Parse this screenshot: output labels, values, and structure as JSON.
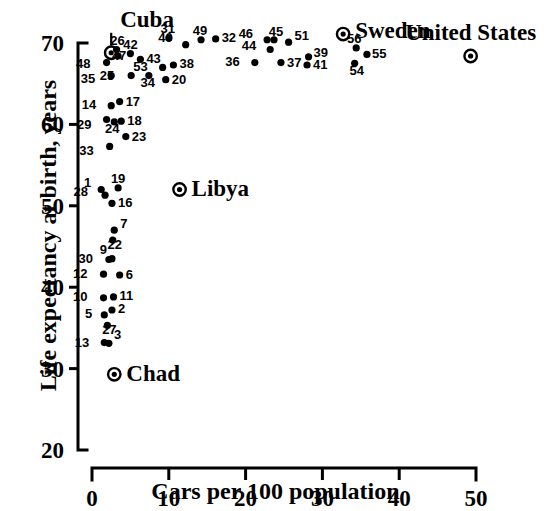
{
  "chart_data": {
    "type": "scatter",
    "title": "",
    "xlabel": "Cars per 100 population",
    "ylabel": "Life expectancy at birth, years",
    "xlim": [
      0,
      50
    ],
    "ylim": [
      20,
      70
    ],
    "xticks": [
      "0",
      "10",
      "20",
      "30",
      "40",
      "50"
    ],
    "xtick_values": [
      0,
      10,
      20,
      30,
      40,
      50
    ],
    "yticks": [
      "20",
      "30",
      "40",
      "50",
      "60",
      "70"
    ],
    "ytick_values": [
      20,
      30,
      40,
      50,
      60,
      70
    ],
    "grid": false,
    "legend": "none",
    "point_label_format": "numeric-index",
    "points": [
      {
        "label": "1",
        "x": 1.2,
        "y": 52.0,
        "label_dx": -10,
        "label_dy": -3
      },
      {
        "label": "2",
        "x": 2.6,
        "y": 37.2,
        "label_dx": 6,
        "label_dy": 3
      },
      {
        "label": "3",
        "x": 2.2,
        "y": 33.1,
        "label_dx": 5,
        "label_dy": -4
      },
      {
        "label": "5",
        "x": 1.6,
        "y": 36.6,
        "label_dx": -12,
        "label_dy": 3
      },
      {
        "label": "6",
        "x": 3.6,
        "y": 41.5,
        "label_dx": 6,
        "label_dy": 4
      },
      {
        "label": "7",
        "x": 2.9,
        "y": 47.0,
        "label_dx": 6,
        "label_dy": -2
      },
      {
        "label": "9",
        "x": 2.6,
        "y": 43.5,
        "label_dx": -5,
        "label_dy": -5
      },
      {
        "label": "10",
        "x": 1.5,
        "y": 38.7,
        "label_dx": -16,
        "label_dy": 3
      },
      {
        "label": "11",
        "x": 2.8,
        "y": 38.8,
        "label_dx": 6,
        "label_dy": 3
      },
      {
        "label": "12",
        "x": 1.5,
        "y": 41.6,
        "label_dx": -16,
        "label_dy": 4
      },
      {
        "label": "13",
        "x": 1.6,
        "y": 33.2,
        "label_dx": -15,
        "label_dy": 4
      },
      {
        "label": "14",
        "x": 2.5,
        "y": 62.3,
        "label_dx": -15,
        "label_dy": 3
      },
      {
        "label": "16",
        "x": 2.6,
        "y": 50.3,
        "label_dx": 6,
        "label_dy": 4
      },
      {
        "label": "17",
        "x": 3.6,
        "y": 62.8,
        "label_dx": 6,
        "label_dy": 4
      },
      {
        "label": "18",
        "x": 3.8,
        "y": 60.4,
        "label_dx": 6,
        "label_dy": 4
      },
      {
        "label": "19",
        "x": 3.4,
        "y": 52.2,
        "label_dx": 0,
        "label_dy": -5
      },
      {
        "label": "20",
        "x": 9.6,
        "y": 65.5,
        "label_dx": 6,
        "label_dy": 4
      },
      {
        "label": "22",
        "x": 2.7,
        "y": 45.8,
        "label_dx": 2,
        "label_dy": 9
      },
      {
        "label": "23",
        "x": 4.4,
        "y": 58.5,
        "label_dx": 6,
        "label_dy": 4
      },
      {
        "label": "24",
        "x": 2.9,
        "y": 60.3,
        "label_dx": -2,
        "label_dy": 11
      },
      {
        "label": "25",
        "x": 5.1,
        "y": 66.0,
        "label_dx": -17,
        "label_dy": 4
      },
      {
        "label": "26",
        "x": 3.2,
        "y": 69.2,
        "label_dx": 1,
        "label_dy": -5
      },
      {
        "label": "27",
        "x": 2.0,
        "y": 35.3,
        "label_dx": 2,
        "label_dy": 9
      },
      {
        "label": "28",
        "x": 1.7,
        "y": 51.3,
        "label_dx": -17,
        "label_dy": 1
      },
      {
        "label": "29",
        "x": 1.9,
        "y": 60.6,
        "label_dx": -15,
        "label_dy": 9
      },
      {
        "label": "30",
        "x": 2.2,
        "y": 43.4,
        "label_dx": -16,
        "label_dy": 3
      },
      {
        "label": "31",
        "x": 10.0,
        "y": 70.6,
        "label_dx": -1,
        "label_dy": -5
      },
      {
        "label": "32",
        "x": 16.1,
        "y": 70.5,
        "label_dx": 6,
        "label_dy": 3
      },
      {
        "label": "33",
        "x": 2.3,
        "y": 57.3,
        "label_dx": -16,
        "label_dy": 9
      },
      {
        "label": "34",
        "x": 7.4,
        "y": 66.0,
        "label_dx": -1,
        "label_dy": 11
      },
      {
        "label": "35",
        "x": 2.5,
        "y": 66.0,
        "label_dx": -16,
        "label_dy": 7
      },
      {
        "label": "36",
        "x": 21.2,
        "y": 67.6,
        "label_dx": -15,
        "label_dy": 3
      },
      {
        "label": "37",
        "x": 24.6,
        "y": 67.6,
        "label_dx": 6,
        "label_dy": 4
      },
      {
        "label": "38",
        "x": 10.6,
        "y": 67.3,
        "label_dx": 6,
        "label_dy": 3
      },
      {
        "label": "39",
        "x": 28.2,
        "y": 68.3,
        "label_dx": 5,
        "label_dy": 0
      },
      {
        "label": "40",
        "x": 12.2,
        "y": 69.8,
        "label_dx": -13,
        "label_dy": -3
      },
      {
        "label": "41",
        "x": 28.0,
        "y": 67.3,
        "label_dx": 6,
        "label_dy": 4
      },
      {
        "label": "42",
        "x": 5.0,
        "y": 68.7,
        "label_dx": 0,
        "label_dy": -5
      },
      {
        "label": "43",
        "x": 6.3,
        "y": 68.0,
        "label_dx": 6,
        "label_dy": 4
      },
      {
        "label": "44",
        "x": 23.2,
        "y": 69.2,
        "label_dx": -14,
        "label_dy": 0
      },
      {
        "label": "45",
        "x": 23.7,
        "y": 70.4,
        "label_dx": 2,
        "label_dy": -4
      },
      {
        "label": "46",
        "x": 22.8,
        "y": 70.4,
        "label_dx": -14,
        "label_dy": -2
      },
      {
        "label": "47",
        "x": 3.4,
        "y": 68.4,
        "label_dx": 1,
        "label_dy": 4
      },
      {
        "label": "48",
        "x": 1.9,
        "y": 67.6,
        "label_dx": -16,
        "label_dy": 5
      },
      {
        "label": "49",
        "x": 14.2,
        "y": 70.4,
        "label_dx": -1,
        "label_dy": -5
      },
      {
        "label": "51",
        "x": 25.6,
        "y": 70.1,
        "label_dx": 6,
        "label_dy": -2
      },
      {
        "label": "53",
        "x": 9.2,
        "y": 67.0,
        "label_dx": -15,
        "label_dy": 4
      },
      {
        "label": "54",
        "x": 34.2,
        "y": 67.5,
        "label_dx": 2,
        "label_dy": 12
      },
      {
        "label": "55",
        "x": 35.8,
        "y": 68.6,
        "label_dx": 5,
        "label_dy": 4
      },
      {
        "label": "56",
        "x": 34.4,
        "y": 69.4,
        "label_dx": -2,
        "label_dy": -5
      }
    ],
    "highlighted": [
      {
        "name": "Cuba",
        "x": 2.5,
        "y": 68.8,
        "label_pos": "above",
        "label_dx": 9,
        "label_dy": -26
      },
      {
        "name": "Libya",
        "x": 11.4,
        "y": 52.0,
        "label_dx": 12,
        "label_dy": 6
      },
      {
        "name": "Chad",
        "x": 2.9,
        "y": 29.3,
        "label_dx": 12,
        "label_dy": 7
      },
      {
        "name": "Sweden",
        "x": 32.7,
        "y": 71.1,
        "label_dx": 12,
        "label_dy": 4
      },
      {
        "name": "United States",
        "x": 49.3,
        "y": 68.4,
        "label_dx": 0,
        "label_dy": -16,
        "label_anchor": "middle"
      }
    ]
  }
}
